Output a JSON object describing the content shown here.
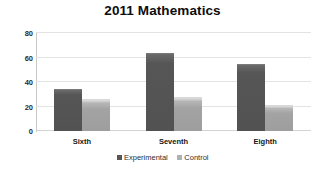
{
  "chart_data": {
    "type": "bar",
    "title": "2011 Mathematics",
    "xlabel": "",
    "ylabel": "",
    "categories": [
      "Sixth",
      "Seventh",
      "Eighth"
    ],
    "series": [
      {
        "name": "Experimental",
        "values": [
          34,
          64,
          55
        ],
        "color": "#565656"
      },
      {
        "name": "Control",
        "values": [
          26,
          28,
          21
        ],
        "color": "#a3a3a3"
      }
    ],
    "ylim": [
      0,
      80
    ],
    "yticks": [
      0,
      20,
      40,
      60,
      80
    ],
    "ytick_labels": [
      "0",
      "20",
      "40",
      "60",
      "80"
    ],
    "grid": true,
    "legend_position": "bottom"
  },
  "legend": {
    "items": [
      {
        "label": "Experimental",
        "swatch": "legend-swatch-experimental"
      },
      {
        "label": "Control",
        "swatch": "legend-swatch-control"
      }
    ]
  }
}
